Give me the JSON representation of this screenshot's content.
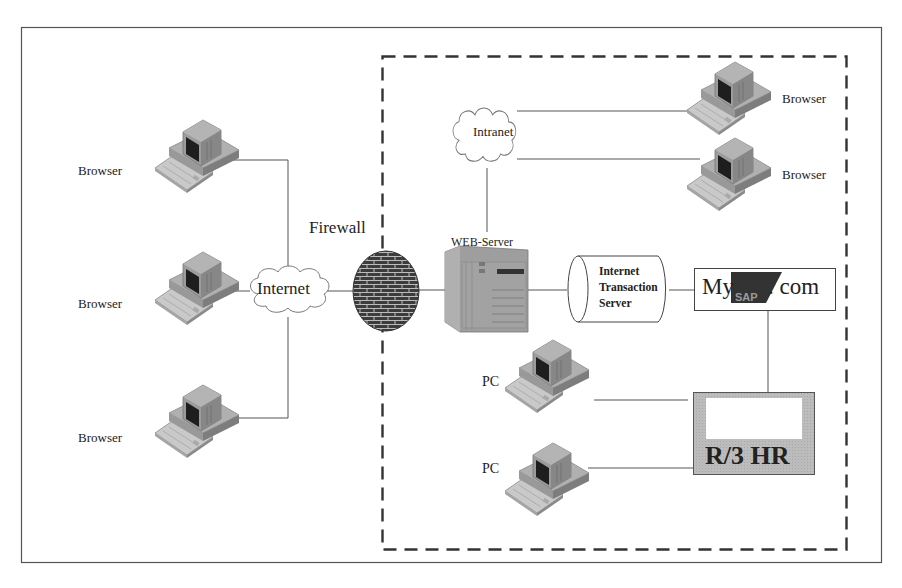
{
  "diagram": {
    "type": "network-architecture",
    "zones": {
      "external": {
        "label": ""
      },
      "internal": {
        "style": "dashed",
        "label": ""
      }
    },
    "nodes": {
      "browser_left_1": {
        "label": "Browser",
        "kind": "pc"
      },
      "browser_left_2": {
        "label": "Browser",
        "kind": "pc"
      },
      "browser_left_3": {
        "label": "Browser",
        "kind": "pc"
      },
      "internet": {
        "label": "Internet",
        "kind": "cloud"
      },
      "firewall": {
        "label": "Firewall",
        "kind": "brick-wall"
      },
      "web_server": {
        "label": "WEB-Server",
        "kind": "server"
      },
      "intranet": {
        "label": "Intranet",
        "kind": "cloud"
      },
      "browser_right_1": {
        "label": "Browser",
        "kind": "pc"
      },
      "browser_right_2": {
        "label": "Browser",
        "kind": "pc"
      },
      "its": {
        "label_lines": [
          "Internet",
          "Transaction",
          "Server"
        ],
        "kind": "cylinder"
      },
      "mysap": {
        "prefix": "My",
        "logo": "SAP",
        "suffix": ". com",
        "kind": "box"
      },
      "pc_1": {
        "label": "PC",
        "kind": "pc"
      },
      "pc_2": {
        "label": "PC",
        "kind": "pc"
      },
      "r3hr": {
        "label": "R/3 HR",
        "kind": "system-box"
      }
    },
    "edges": [
      [
        "browser_left_1",
        "internet"
      ],
      [
        "browser_left_2",
        "internet"
      ],
      [
        "browser_left_3",
        "internet"
      ],
      [
        "internet",
        "firewall"
      ],
      [
        "firewall",
        "web_server"
      ],
      [
        "web_server",
        "intranet"
      ],
      [
        "intranet",
        "browser_right_1"
      ],
      [
        "intranet",
        "browser_right_2"
      ],
      [
        "web_server",
        "its"
      ],
      [
        "its",
        "mysap"
      ],
      [
        "mysap",
        "r3hr"
      ],
      [
        "pc_1",
        "r3hr"
      ],
      [
        "pc_2",
        "r3hr"
      ]
    ],
    "colors": {
      "line": "#444444",
      "pc_body": "#9a9a9a",
      "pc_top": "#b5b5b5",
      "pc_screen": "#1e1e1e",
      "r3_fill": "#b8b8b8",
      "sap_logo": "#333333",
      "firewall": "#3a3a3a"
    }
  }
}
